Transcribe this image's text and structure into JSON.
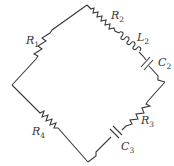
{
  "diagram": {
    "type": "circuit",
    "shape": "diamond",
    "line_color": "#3a3a3a",
    "components": [
      {
        "id": "R1",
        "kind": "resistor",
        "letter": "R",
        "sub": "1",
        "edge": "left-top"
      },
      {
        "id": "R2",
        "kind": "resistor",
        "letter": "R",
        "sub": "2",
        "edge": "top-right"
      },
      {
        "id": "L2",
        "kind": "inductor",
        "letter": "L",
        "sub": "2",
        "edge": "top-right"
      },
      {
        "id": "C2",
        "kind": "capacitor",
        "letter": "C",
        "sub": "2",
        "edge": "top-right"
      },
      {
        "id": "R3",
        "kind": "resistor",
        "letter": "R",
        "sub": "3",
        "edge": "right-bottom"
      },
      {
        "id": "C3",
        "kind": "capacitor",
        "letter": "C",
        "sub": "3",
        "edge": "right-bottom"
      },
      {
        "id": "R4",
        "kind": "resistor",
        "letter": "R",
        "sub": "4",
        "edge": "left-bottom"
      }
    ]
  }
}
